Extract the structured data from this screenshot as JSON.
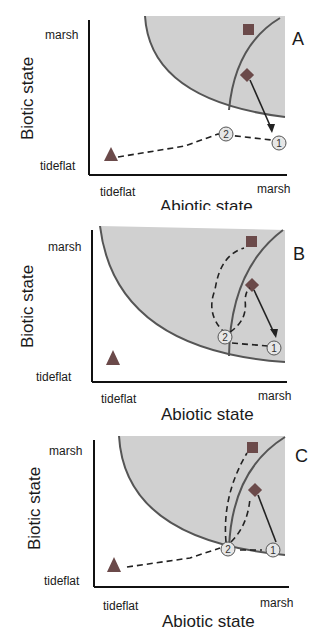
{
  "panels": [
    {
      "id": "A",
      "letter": "A",
      "y_label": "Biotic state",
      "x_label": "Abiotic state",
      "y_ticks": {
        "top": "marsh",
        "bottom": "tideflat"
      },
      "x_ticks": {
        "left": "tideflat",
        "right": "marsh"
      },
      "nodes": [
        "1",
        "2"
      ]
    },
    {
      "id": "B",
      "letter": "B",
      "y_label": "Biotic state",
      "x_label": "Abiotic state",
      "y_ticks": {
        "top": "marsh",
        "bottom": "tideflat"
      },
      "x_ticks": {
        "left": "tideflat",
        "right": "marsh"
      },
      "nodes": [
        "1",
        "2"
      ]
    },
    {
      "id": "C",
      "letter": "C",
      "y_label": "Biotic state",
      "x_label": "Abiotic state",
      "y_ticks": {
        "top": "marsh",
        "bottom": "tideflat"
      },
      "x_ticks": {
        "left": "tideflat",
        "right": "marsh"
      },
      "nodes": [
        "1",
        "2"
      ]
    }
  ],
  "colors": {
    "shade": "#d0d0d0",
    "curve": "#555555",
    "marker": "#6b4a4a",
    "axis": "#111111",
    "node_fill": "#e6e6e6"
  }
}
